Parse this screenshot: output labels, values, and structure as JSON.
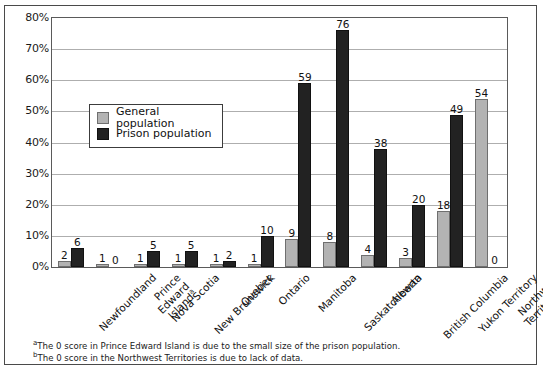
{
  "chart_data": {
    "type": "bar",
    "title": "",
    "subtitle": "",
    "xlabel": "",
    "ylabel": "",
    "ylim": [
      0,
      80
    ],
    "ytick_labels": [
      "0%",
      "10%",
      "20%",
      "30%",
      "40%",
      "50%",
      "60%",
      "70%",
      "80%"
    ],
    "ytick_values": [
      0,
      10,
      20,
      30,
      40,
      50,
      60,
      70,
      80
    ],
    "grid": true,
    "legend_position": "upper-left-inside",
    "categories": [
      "Newfoundland",
      "Prince Edward Island",
      "Nova Scotia",
      "New Brunswick",
      "Quebec",
      "Ontario",
      "Manitoba",
      "Saskatchewan",
      "Alberta",
      "British Columbia",
      "Yukon Territory",
      "Northwest Territories"
    ],
    "category_footnote_markers": [
      "",
      "a",
      "",
      "",
      "",
      "",
      "",
      "",
      "",
      "",
      "",
      "b"
    ],
    "series": [
      {
        "name": "General population",
        "color": "#b3b3b3",
        "values": [
          2,
          1,
          1,
          1,
          1,
          1,
          9,
          8,
          4,
          3,
          18,
          54
        ]
      },
      {
        "name": "Prison population",
        "color": "#222222",
        "values": [
          6,
          0,
          5,
          5,
          2,
          10,
          59,
          76,
          38,
          20,
          49,
          0
        ]
      }
    ]
  },
  "legend": {
    "items": [
      {
        "label": "General population",
        "swatch": "general"
      },
      {
        "label": "Prison population",
        "swatch": "prison"
      }
    ]
  },
  "footnotes": [
    {
      "marker": "a",
      "text": "The 0 score in Prince Edward Island is due to the small size of the prison population."
    },
    {
      "marker": "b",
      "text": "The 0 score in the Northwest Territories is due to lack of data."
    }
  ]
}
